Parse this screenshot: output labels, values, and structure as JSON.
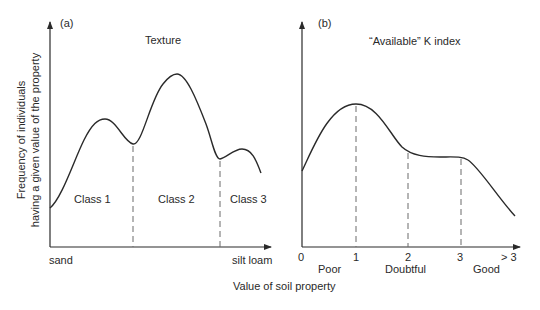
{
  "figure": {
    "y_axis_label_line1": "Frequency of individuals",
    "y_axis_label_line2": "having a given value of the property",
    "x_axis_label": "Value of soil property"
  },
  "panel_a": {
    "tag": "(a)",
    "title": "Texture",
    "x_start_label": "sand",
    "x_end_label": "silt loam",
    "classes": [
      "Class 1",
      "Class 2",
      "Class 3"
    ]
  },
  "panel_b": {
    "tag": "(b)",
    "title": "“Available” K index",
    "ticks": [
      "0",
      "1",
      "2",
      "3",
      "> 3"
    ],
    "categories": [
      "Poor",
      "Doubtful",
      "Good"
    ]
  },
  "colors": {
    "line": "#2a2a2a",
    "dash": "#6a6a6a",
    "background": "#ffffff"
  }
}
